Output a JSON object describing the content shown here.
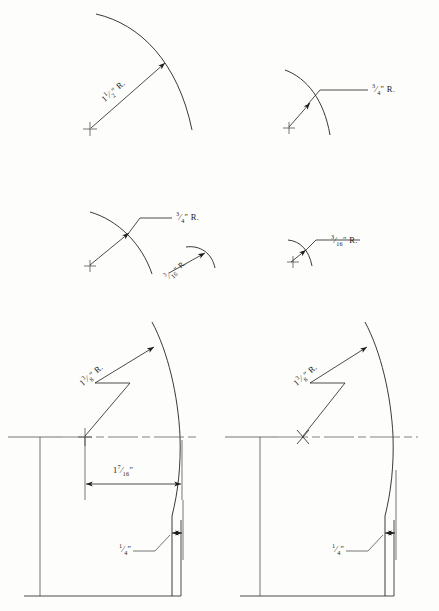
{
  "sheet": {
    "background_color": "#fdfdfb",
    "ink_color": "#2b2b2b",
    "width": 439,
    "height": 611,
    "kind": "engineering-radius-detail-drawing"
  },
  "figures": [
    {
      "id": "fig-top-left",
      "position": "top-left",
      "radius_label": "1½″ R.",
      "label_rotated": true,
      "center_mark": "plus",
      "description": "large quarter arc with radius leader from cross center"
    },
    {
      "id": "fig-top-right",
      "position": "top-right",
      "radius_label": "¾″ R.",
      "label_rotated": false,
      "center_mark": "plus",
      "description": "arc with horizontal leader line to radius note"
    },
    {
      "id": "fig-mid-left",
      "position": "middle-left",
      "radius_label": "¾″ R.",
      "label_rotated": false,
      "center_mark": "plus",
      "description": "arc with horizontal leader line to radius note"
    },
    {
      "id": "fig-mid-left-inset",
      "position": "middle-left-inset",
      "radius_label": "3/16″ R.",
      "label_rotated": true,
      "center_mark": "none",
      "description": "small inset arc with rotated radius note"
    },
    {
      "id": "fig-mid-right",
      "position": "middle-right",
      "radius_label": "3/16″ R.",
      "label_rotated": false,
      "center_mark": "plus",
      "description": "small arc with horizontal leader line to radius note"
    },
    {
      "id": "fig-bottom-left",
      "position": "bottom-left",
      "radius_label": "1⅜″ R.",
      "width_label": "1⁷⁄₁₆″",
      "thickness_label": "¼″",
      "center_mark": "plus",
      "has_centerline": true,
      "description": "profile section with swept curve, overall width dimension and edge thickness"
    },
    {
      "id": "fig-bottom-right",
      "position": "bottom-right",
      "radius_label": "1⅜″ R.",
      "thickness_label": "¼″",
      "center_mark": "cross-x",
      "has_centerline": true,
      "description": "profile section with swept curve and edge thickness only"
    }
  ],
  "labels": {
    "fig1_radius": "R.",
    "fig1_value_whole": "1",
    "fig1_value_num": "1",
    "fig1_value_den": "2",
    "fig2_radius": "R.",
    "fig2_value_num": "3",
    "fig2_value_den": "4",
    "fig3_radius": "R.",
    "fig3_value_num": "3",
    "fig3_value_den": "4",
    "fig3b_radius": "R.",
    "fig3b_value_num": "3",
    "fig3b_value_den": "16",
    "fig4_radius": "R.",
    "fig4_value_num": "3",
    "fig4_value_den": "16",
    "fig5_radius": "R.",
    "fig5_value_whole": "1",
    "fig5_value_num": "3",
    "fig5_value_den": "8",
    "fig5_width_whole": "1",
    "fig5_width_num": "7",
    "fig5_width_den": "16",
    "fig5_thick_num": "1",
    "fig5_thick_den": "4",
    "fig6_radius": "R.",
    "fig6_value_whole": "1",
    "fig6_value_num": "3",
    "fig6_value_den": "8",
    "fig6_thick_num": "1",
    "fig6_thick_den": "4",
    "inch_mark": "″"
  }
}
